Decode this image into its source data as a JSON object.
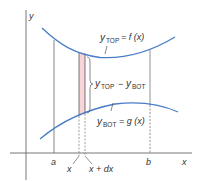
{
  "diagram": {
    "type": "area-between-curves",
    "axes": {
      "x_label": "x",
      "y_label": "y"
    },
    "curves": {
      "top": {
        "label_var": "y",
        "label_sub": "TOP",
        "label_rhs": "= f (x)"
      },
      "bottom": {
        "label_var": "y",
        "label_sub": "BOT",
        "label_rhs": "= g (x)"
      }
    },
    "strip": {
      "height_var1": "y",
      "height_sub1": "TOP",
      "height_minus": "−",
      "height_var2": "y",
      "height_sub2": "BOT",
      "left_label": "x",
      "right_label": "x + dx"
    },
    "bounds": {
      "a": "a",
      "b": "b"
    },
    "colors": {
      "curve": "#4a7cc7",
      "strip_fill": "#f6d4d8",
      "lines": "#555555"
    }
  }
}
